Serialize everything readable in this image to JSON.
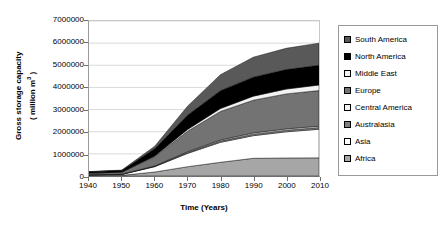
{
  "chart_data": {
    "type": "area",
    "stacked": true,
    "title": "",
    "xlabel": "Time (Years)",
    "ylabel": "Gross storage capacity ( million m3 )",
    "ylabel_line1": "Gross storage capacity",
    "ylabel_line2_prefix": "( million m",
    "ylabel_line2_sup": "3",
    "ylabel_line2_suffix": " )",
    "x": [
      1940,
      1950,
      1960,
      1970,
      1980,
      1990,
      2000,
      2010
    ],
    "xticklabels": [
      "1940",
      "1950",
      "1960",
      "1970",
      "1980",
      "1990",
      "2000",
      "2010"
    ],
    "yticklabels": [
      "0",
      "1000000",
      "2000000",
      "3000000",
      "4000000",
      "5000000",
      "6000000",
      "7000000"
    ],
    "yticks": [
      0,
      1000000,
      2000000,
      3000000,
      4000000,
      5000000,
      6000000,
      7000000
    ],
    "xlim": [
      1940,
      2010
    ],
    "ylim": [
      0,
      7000000
    ],
    "grid": "horizontal",
    "legend_position": "right",
    "stack_order_bottom_to_top": [
      "Africa",
      "Asia",
      "Australasia",
      "Central America",
      "Europe",
      "Middle East",
      "North America",
      "South America"
    ],
    "series": [
      {
        "name": "Africa",
        "color": "#a6a6a6",
        "values": [
          20000,
          30000,
          180000,
          420000,
          620000,
          800000,
          815000,
          820000
        ]
      },
      {
        "name": "Asia",
        "color": "#ffffff",
        "values": [
          30000,
          40000,
          240000,
          600000,
          900000,
          1020000,
          1180000,
          1290000
        ]
      },
      {
        "name": "Australasia",
        "color": "#808080",
        "values": [
          5000,
          8000,
          20000,
          45000,
          60000,
          70000,
          75000,
          80000
        ]
      },
      {
        "name": "Central America",
        "color": "#f2f2f2",
        "values": [
          4000,
          6000,
          14000,
          30000,
          45000,
          55000,
          58000,
          60000
        ]
      },
      {
        "name": "Europe",
        "color": "#737373",
        "values": [
          70000,
          90000,
          420000,
          930000,
          1290000,
          1480000,
          1580000,
          1610000
        ]
      },
      {
        "name": "Middle East",
        "color": "#f2f2f2",
        "values": [
          6000,
          8000,
          30000,
          80000,
          130000,
          180000,
          220000,
          250000
        ]
      },
      {
        "name": "North America",
        "color": "#000000",
        "values": [
          55000,
          70000,
          330000,
          640000,
          810000,
          860000,
          880000,
          890000
        ]
      },
      {
        "name": "South America",
        "color": "#595959",
        "values": [
          10000,
          15000,
          110000,
          410000,
          720000,
          900000,
          960000,
          1000000
        ]
      }
    ],
    "totals": [
      200000,
      267000,
      1344000,
      3155000,
      4575000,
      5365000,
      5768000,
      6000000
    ]
  },
  "legend": {
    "items": [
      {
        "label": "South America",
        "color": "#595959"
      },
      {
        "label": "North America",
        "color": "#000000"
      },
      {
        "label": "Middle East",
        "color": "#f2f2f2"
      },
      {
        "label": "Europe",
        "color": "#737373"
      },
      {
        "label": "Central America",
        "color": "#f2f2f2"
      },
      {
        "label": "Australasia",
        "color": "#808080"
      },
      {
        "label": "Asia",
        "color": "#ffffff"
      },
      {
        "label": "Africa",
        "color": "#a6a6a6"
      }
    ]
  },
  "colors": {
    "axis": "#6e6e6e",
    "grid": "#c9c9c9",
    "text": "#000000",
    "background": "#ffffff"
  }
}
